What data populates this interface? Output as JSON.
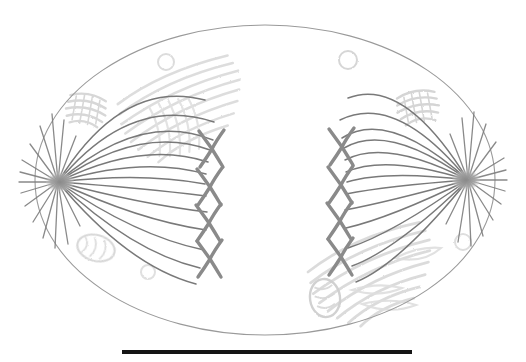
{
  "figure": {
    "title": "Cell in anaphase of mitosis",
    "style": "pencil sketch",
    "background_color": "#ffffff",
    "width": 526,
    "height": 362
  },
  "colors": {
    "membrane_stroke": "#9a9a9a",
    "spindle_fiber_stroke": "#6e6e6e",
    "aster_fiber_stroke": "#7d7d7d",
    "chromosome_stroke": "#8a8a8a",
    "centrosome_fill": "#9e9e9e",
    "organelle_faint": "#d8d8d8",
    "organelle_very_faint": "#e6e6e6",
    "scale_bar_color": "#151515"
  },
  "cell": {
    "label": "cell membrane",
    "shape": "ellipse",
    "center_x": 265,
    "center_y": 180,
    "radius_x": 230,
    "radius_y": 155,
    "stroke_width": 1.1
  },
  "poles": [
    {
      "name": "left-pole",
      "label": "centrosome (left pole)",
      "x": 58,
      "y": 182,
      "aster_count": 15,
      "spindle_count": 13
    },
    {
      "name": "right-pole",
      "label": "centrosome (right pole)",
      "x": 468,
      "y": 180,
      "aster_count": 15,
      "spindle_count": 13
    }
  ],
  "chromosome_groups": [
    {
      "name": "left-chromosome-group",
      "label": "chromatids migrating to left pole",
      "count": 4,
      "x": 210,
      "ys": [
        148,
        186,
        222,
        258
      ],
      "orientation": "x-shape"
    },
    {
      "name": "right-chromosome-group",
      "label": "chromatids migrating to right pole",
      "count": 4,
      "x": 340,
      "ys": [
        146,
        184,
        220,
        256
      ],
      "orientation": "x-shape"
    }
  ],
  "organelles": [
    {
      "name": "endoplasmic-reticulum-upper-left",
      "label": "endoplasmic reticulum",
      "cx": 185,
      "cy": 105,
      "angle": -22,
      "strands": 8
    },
    {
      "name": "endoplasmic-reticulum-lower-right",
      "label": "endoplasmic reticulum",
      "cx": 375,
      "cy": 275,
      "angle": -24,
      "strands": 8
    },
    {
      "name": "golgi-upper-left",
      "label": "golgi apparatus",
      "cx": 86,
      "cy": 110,
      "angle": 10
    },
    {
      "name": "golgi-upper-right",
      "label": "golgi apparatus",
      "cx": 418,
      "cy": 108,
      "angle": -10
    },
    {
      "name": "mitochondrion-lower-left",
      "label": "mitochondrion",
      "cx": 96,
      "cy": 248,
      "angle": 15
    },
    {
      "name": "mitochondrion-lower-center",
      "label": "mitochondrion",
      "cx": 325,
      "cy": 298,
      "angle": -8
    },
    {
      "name": "vesicle-upper-left",
      "label": "vesicle",
      "cx": 166,
      "cy": 62,
      "r": 8
    },
    {
      "name": "vesicle-upper-right",
      "label": "vesicle",
      "cx": 348,
      "cy": 60,
      "r": 9
    },
    {
      "name": "vesicle-lower-left",
      "label": "vesicle",
      "cx": 148,
      "cy": 272,
      "r": 7
    },
    {
      "name": "vesicle-lower-right",
      "label": "vesicle",
      "cx": 463,
      "cy": 242,
      "r": 8
    }
  ],
  "scale_bar": {
    "name": "scale-bar",
    "label": "scale bar",
    "x_start": 122,
    "x_end": 412,
    "y": 352,
    "thickness": 4,
    "color": "#151515"
  }
}
